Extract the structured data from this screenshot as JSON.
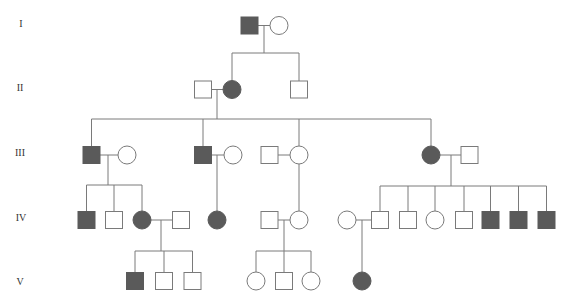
{
  "diagram": {
    "type": "pedigree",
    "colors": {
      "line": "#7a7a7a",
      "affected_fill": "#5a5a5a",
      "unaffected_fill": "#ffffff",
      "background": "#ffffff"
    },
    "generation_labels": [
      {
        "label": "I",
        "x": 21,
        "y": 23
      },
      {
        "label": "II",
        "x": 20,
        "y": 87
      },
      {
        "label": "III",
        "x": 20,
        "y": 152
      },
      {
        "label": "IV",
        "x": 21,
        "y": 217
      },
      {
        "label": "V",
        "x": 20,
        "y": 281
      }
    ],
    "individuals": [
      {
        "id": "I-1",
        "generation": "I",
        "sex": "male",
        "affected": true,
        "x": 249.5,
        "y": 25.5
      },
      {
        "id": "I-2",
        "generation": "I",
        "sex": "female",
        "affected": false,
        "x": 279,
        "y": 25.5
      },
      {
        "id": "II-1",
        "generation": "II",
        "sex": "male",
        "affected": false,
        "x": 203,
        "y": 89.5
      },
      {
        "id": "II-2",
        "generation": "II",
        "sex": "female",
        "affected": true,
        "x": 232,
        "y": 89.5
      },
      {
        "id": "II-3",
        "generation": "II",
        "sex": "male",
        "affected": false,
        "x": 299,
        "y": 89.5
      },
      {
        "id": "III-1",
        "generation": "III",
        "sex": "male",
        "affected": true,
        "x": 91.5,
        "y": 155
      },
      {
        "id": "III-2",
        "generation": "III",
        "sex": "female",
        "affected": false,
        "x": 127,
        "y": 155
      },
      {
        "id": "III-3",
        "generation": "III",
        "sex": "male",
        "affected": true,
        "x": 203,
        "y": 155
      },
      {
        "id": "III-4",
        "generation": "III",
        "sex": "female",
        "affected": false,
        "x": 233,
        "y": 155
      },
      {
        "id": "III-5",
        "generation": "III",
        "sex": "male",
        "affected": false,
        "x": 269.5,
        "y": 155
      },
      {
        "id": "III-6",
        "generation": "III",
        "sex": "female",
        "affected": false,
        "x": 299,
        "y": 155
      },
      {
        "id": "III-7",
        "generation": "III",
        "sex": "female",
        "affected": true,
        "x": 431,
        "y": 155
      },
      {
        "id": "III-8",
        "generation": "III",
        "sex": "male",
        "affected": false,
        "x": 469.5,
        "y": 155
      },
      {
        "id": "IV-1",
        "generation": "IV",
        "sex": "male",
        "affected": true,
        "x": 86.5,
        "y": 220
      },
      {
        "id": "IV-2",
        "generation": "IV",
        "sex": "male",
        "affected": false,
        "x": 114,
        "y": 220
      },
      {
        "id": "IV-3",
        "generation": "IV",
        "sex": "female",
        "affected": true,
        "x": 142,
        "y": 220
      },
      {
        "id": "IV-4",
        "generation": "IV",
        "sex": "male",
        "affected": false,
        "x": 181,
        "y": 220
      },
      {
        "id": "IV-5",
        "generation": "IV",
        "sex": "female",
        "affected": true,
        "x": 217,
        "y": 220
      },
      {
        "id": "IV-6",
        "generation": "IV",
        "sex": "male",
        "affected": false,
        "x": 269.5,
        "y": 220
      },
      {
        "id": "IV-7",
        "generation": "IV",
        "sex": "female",
        "affected": false,
        "x": 299,
        "y": 220
      },
      {
        "id": "IV-8",
        "generation": "IV",
        "sex": "female",
        "affected": false,
        "x": 347,
        "y": 220
      },
      {
        "id": "IV-9",
        "generation": "IV",
        "sex": "male",
        "affected": false,
        "x": 380,
        "y": 220
      },
      {
        "id": "IV-10",
        "generation": "IV",
        "sex": "male",
        "affected": false,
        "x": 408,
        "y": 220
      },
      {
        "id": "IV-11",
        "generation": "IV",
        "sex": "female",
        "affected": false,
        "x": 435,
        "y": 220
      },
      {
        "id": "IV-12",
        "generation": "IV",
        "sex": "male",
        "affected": false,
        "x": 464,
        "y": 220
      },
      {
        "id": "IV-13",
        "generation": "IV",
        "sex": "male",
        "affected": true,
        "x": 490.5,
        "y": 220
      },
      {
        "id": "IV-14",
        "generation": "IV",
        "sex": "male",
        "affected": true,
        "x": 518.5,
        "y": 220
      },
      {
        "id": "IV-15",
        "generation": "IV",
        "sex": "male",
        "affected": true,
        "x": 546.5,
        "y": 220
      },
      {
        "id": "V-1",
        "generation": "V",
        "sex": "male",
        "affected": true,
        "x": 135,
        "y": 281
      },
      {
        "id": "V-2",
        "generation": "V",
        "sex": "male",
        "affected": false,
        "x": 164,
        "y": 281
      },
      {
        "id": "V-3",
        "generation": "V",
        "sex": "male",
        "affected": false,
        "x": 192.5,
        "y": 281
      },
      {
        "id": "V-4",
        "generation": "V",
        "sex": "female",
        "affected": false,
        "x": 256,
        "y": 281
      },
      {
        "id": "V-5",
        "generation": "V",
        "sex": "male",
        "affected": false,
        "x": 284,
        "y": 281
      },
      {
        "id": "V-6",
        "generation": "V",
        "sex": "female",
        "affected": false,
        "x": 311,
        "y": 281
      },
      {
        "id": "V-7",
        "generation": "V",
        "sex": "female",
        "affected": true,
        "x": 362,
        "y": 281
      }
    ],
    "lines": [
      {
        "name": "marriage-I",
        "x1": 258,
        "y1": 25.5,
        "x2": 270,
        "y2": 25.5
      },
      {
        "name": "descent-I",
        "x1": 264,
        "y1": 25.5,
        "x2": 264,
        "y2": 53
      },
      {
        "name": "sibship-II",
        "x1": 232,
        "y1": 53,
        "x2": 299,
        "y2": 53
      },
      {
        "name": "drop-II-2",
        "x1": 232,
        "y1": 53,
        "x2": 232,
        "y2": 80.5
      },
      {
        "name": "drop-II-3",
        "x1": 299,
        "y1": 53,
        "x2": 299,
        "y2": 81
      },
      {
        "name": "marriage-II",
        "x1": 211,
        "y1": 89.5,
        "x2": 223,
        "y2": 89.5
      },
      {
        "name": "descent-II",
        "x1": 217,
        "y1": 89.5,
        "x2": 217,
        "y2": 119
      },
      {
        "name": "sibship-III",
        "x1": 91.5,
        "y1": 119,
        "x2": 431,
        "y2": 119
      },
      {
        "name": "drop-III-1",
        "x1": 91.5,
        "y1": 119,
        "x2": 91.5,
        "y2": 147
      },
      {
        "name": "drop-III-3",
        "x1": 203,
        "y1": 119,
        "x2": 203,
        "y2": 147
      },
      {
        "name": "drop-III-6",
        "x1": 299,
        "y1": 119,
        "x2": 299,
        "y2": 146
      },
      {
        "name": "drop-III-7",
        "x1": 431,
        "y1": 119,
        "x2": 431,
        "y2": 146
      },
      {
        "name": "marriage-III-1",
        "x1": 100,
        "y1": 155,
        "x2": 118,
        "y2": 155
      },
      {
        "name": "descent-III-1",
        "x1": 108,
        "y1": 155,
        "x2": 108,
        "y2": 185
      },
      {
        "name": "sibship-IV-a",
        "x1": 86.5,
        "y1": 185,
        "x2": 142,
        "y2": 185
      },
      {
        "name": "drop-IV-1",
        "x1": 86.5,
        "y1": 185,
        "x2": 86.5,
        "y2": 212
      },
      {
        "name": "drop-IV-2",
        "x1": 114,
        "y1": 185,
        "x2": 114,
        "y2": 212
      },
      {
        "name": "drop-IV-3",
        "x1": 142,
        "y1": 185,
        "x2": 142,
        "y2": 211
      },
      {
        "name": "marriage-III-3",
        "x1": 211,
        "y1": 155,
        "x2": 224,
        "y2": 155
      },
      {
        "name": "descent-III-3",
        "x1": 217,
        "y1": 155,
        "x2": 217,
        "y2": 211
      },
      {
        "name": "marriage-III-5",
        "x1": 277,
        "y1": 155,
        "x2": 290,
        "y2": 155
      },
      {
        "name": "drop-IV-7",
        "x1": 299,
        "y1": 164,
        "x2": 299,
        "y2": 211
      },
      {
        "name": "marriage-III-7",
        "x1": 440,
        "y1": 155,
        "x2": 461,
        "y2": 155
      },
      {
        "name": "descent-III-7",
        "x1": 451,
        "y1": 155,
        "x2": 451,
        "y2": 186
      },
      {
        "name": "sibship-IV-b",
        "x1": 380,
        "y1": 186,
        "x2": 546.5,
        "y2": 186
      },
      {
        "name": "drop-IV-9",
        "x1": 380,
        "y1": 186,
        "x2": 380,
        "y2": 212
      },
      {
        "name": "drop-IV-10",
        "x1": 408,
        "y1": 186,
        "x2": 408,
        "y2": 212
      },
      {
        "name": "drop-IV-11",
        "x1": 435,
        "y1": 186,
        "x2": 435,
        "y2": 211
      },
      {
        "name": "drop-IV-12",
        "x1": 464,
        "y1": 186,
        "x2": 464,
        "y2": 212
      },
      {
        "name": "drop-IV-13",
        "x1": 490.5,
        "y1": 186,
        "x2": 490.5,
        "y2": 212
      },
      {
        "name": "drop-IV-14",
        "x1": 518.5,
        "y1": 186,
        "x2": 518.5,
        "y2": 212
      },
      {
        "name": "drop-IV-15",
        "x1": 546.5,
        "y1": 186,
        "x2": 546.5,
        "y2": 212
      },
      {
        "name": "marriage-IV-3",
        "x1": 151,
        "y1": 220,
        "x2": 173,
        "y2": 220
      },
      {
        "name": "descent-IV-3",
        "x1": 161,
        "y1": 220,
        "x2": 161,
        "y2": 251
      },
      {
        "name": "sibship-V-a",
        "x1": 135,
        "y1": 251,
        "x2": 192.5,
        "y2": 251
      },
      {
        "name": "drop-V-1",
        "x1": 135,
        "y1": 251,
        "x2": 135,
        "y2": 273
      },
      {
        "name": "drop-V-2",
        "x1": 164,
        "y1": 251,
        "x2": 164,
        "y2": 273
      },
      {
        "name": "drop-V-3",
        "x1": 192.5,
        "y1": 251,
        "x2": 192.5,
        "y2": 273
      },
      {
        "name": "marriage-IV-6",
        "x1": 277,
        "y1": 220,
        "x2": 290,
        "y2": 220
      },
      {
        "name": "descent-IV-6",
        "x1": 284,
        "y1": 220,
        "x2": 284,
        "y2": 251
      },
      {
        "name": "sibship-V-b",
        "x1": 256,
        "y1": 251,
        "x2": 311,
        "y2": 251
      },
      {
        "name": "drop-V-4",
        "x1": 256,
        "y1": 251,
        "x2": 256,
        "y2": 272
      },
      {
        "name": "drop-V-5",
        "x1": 284,
        "y1": 251,
        "x2": 284,
        "y2": 273
      },
      {
        "name": "drop-V-6",
        "x1": 311,
        "y1": 251,
        "x2": 311,
        "y2": 272
      },
      {
        "name": "marriage-IV-8",
        "x1": 356,
        "y1": 220,
        "x2": 372,
        "y2": 220
      },
      {
        "name": "descent-IV-8",
        "x1": 362,
        "y1": 220,
        "x2": 362,
        "y2": 272
      }
    ],
    "symbol_size": {
      "square_side": 17,
      "circle_radius": 9
    }
  }
}
